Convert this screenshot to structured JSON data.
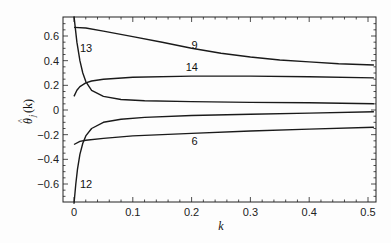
{
  "chart_data": {
    "type": "line",
    "title": "",
    "xlabel": "k",
    "ylabel": "θ̂_j(k)",
    "xlim": [
      -0.02,
      0.52
    ],
    "ylim": [
      -0.76,
      0.76
    ],
    "xticks": [
      0,
      0.1,
      0.2,
      0.3,
      0.4,
      0.5
    ],
    "xtick_labels": [
      "0",
      "0.1",
      "0.2",
      "0.3",
      "0.4",
      "0.5"
    ],
    "yticks": [
      -0.6,
      -0.4,
      -0.2,
      0,
      0.2,
      0.4,
      0.6
    ],
    "ytick_labels": [
      "−0.6",
      "−0.4",
      "−0.2",
      "0",
      "0.2",
      "0.4",
      "0.6"
    ],
    "grid": false,
    "legend": "none (curves labelled inline)",
    "series": [
      {
        "name": "9",
        "label_at": [
          0.2,
          0.53
        ],
        "x": [
          0.0,
          0.02,
          0.05,
          0.1,
          0.15,
          0.2,
          0.25,
          0.3,
          0.35,
          0.4,
          0.45,
          0.51
        ],
        "values": [
          0.67,
          0.665,
          0.64,
          0.595,
          0.55,
          0.5,
          0.46,
          0.43,
          0.405,
          0.39,
          0.375,
          0.365
        ]
      },
      {
        "name": "14",
        "label_at": [
          0.19,
          0.35
        ],
        "x": [
          0.0,
          0.005,
          0.01,
          0.02,
          0.03,
          0.05,
          0.1,
          0.2,
          0.3,
          0.4,
          0.51
        ],
        "values": [
          0.11,
          0.16,
          0.19,
          0.22,
          0.235,
          0.25,
          0.265,
          0.275,
          0.275,
          0.27,
          0.26
        ]
      },
      {
        "name": "13",
        "label_at": [
          0.01,
          0.5
        ],
        "x": [
          0.0,
          0.005,
          0.01,
          0.015,
          0.02,
          0.03,
          0.05,
          0.08,
          0.12,
          0.2,
          0.3,
          0.4,
          0.51
        ],
        "values": [
          0.76,
          0.55,
          0.4,
          0.3,
          0.23,
          0.16,
          0.11,
          0.085,
          0.075,
          0.068,
          0.062,
          0.058,
          0.05
        ]
      },
      {
        "name": "12",
        "label_at": [
          0.01,
          -0.6
        ],
        "x": [
          0.0,
          0.003,
          0.006,
          0.01,
          0.015,
          0.02,
          0.03,
          0.05,
          0.08,
          0.12,
          0.2,
          0.3,
          0.4,
          0.51
        ],
        "values": [
          -0.76,
          -0.6,
          -0.48,
          -0.36,
          -0.27,
          -0.21,
          -0.15,
          -0.1,
          -0.075,
          -0.06,
          -0.045,
          -0.035,
          -0.025,
          -0.015
        ]
      },
      {
        "name": "6",
        "label_at": [
          0.2,
          -0.25
        ],
        "x": [
          0.0,
          0.01,
          0.02,
          0.05,
          0.1,
          0.2,
          0.3,
          0.4,
          0.51
        ],
        "values": [
          -0.28,
          -0.255,
          -0.245,
          -0.23,
          -0.21,
          -0.19,
          -0.17,
          -0.155,
          -0.14
        ]
      }
    ]
  },
  "labels": {
    "x_axis": "k",
    "y_axis_main": "θ",
    "y_axis_hat": "^",
    "y_axis_sub": "j",
    "y_axis_arg": "(k)"
  }
}
